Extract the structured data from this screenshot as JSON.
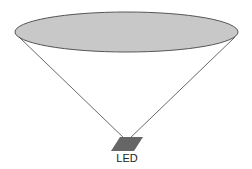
{
  "diagram": {
    "type": "light-cone",
    "source_label": "LED",
    "colors": {
      "ellipse_fill": "#c8c8c8",
      "ellipse_stroke": "#555555",
      "cone_line": "#444444",
      "led_fill": "#666666"
    },
    "ellipse": {
      "cx": 126.5,
      "cy": 32,
      "rx": 111.5,
      "ry": 20
    },
    "apex": {
      "x": 127,
      "y": 141
    }
  }
}
